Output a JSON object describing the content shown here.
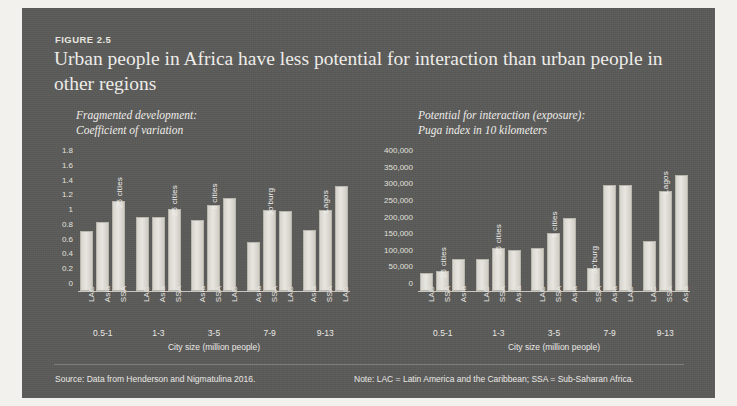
{
  "figure": {
    "label": "FIGURE 2.5",
    "title": "Urban people in Africa have less potential for interaction than urban people in other regions",
    "source": "Source: Data from Henderson and Nigmatulina 2016.",
    "note": "Note: LAC = Latin America and the Caribbean; SSA = Sub-Saharan Africa.",
    "card_color": "#5a5a59",
    "bar_color": "#e0ded7",
    "text_color": "#e9e7e2"
  },
  "chart_data": [
    {
      "type": "bar",
      "panel": "left",
      "title": "Fragmented development:\nCoefficient of variation",
      "subtitle_line1": "Fragmented development:",
      "subtitle_line2": "Coefficient of variation",
      "xlabel": "City size (million people)",
      "ylabel": "Coefficient of variation",
      "ylim": [
        0,
        1.8
      ],
      "yticks": [
        "0",
        "0.2",
        "0.4",
        "0.6",
        "0.8",
        "1",
        "1.2",
        "1.4",
        "1.6",
        "1.8"
      ],
      "ytick_values": [
        0,
        0.2,
        0.4,
        0.6,
        0.8,
        1.0,
        1.2,
        1.4,
        1.6,
        1.8
      ],
      "grid": false,
      "legend": "none",
      "categories": [
        "0.5-1",
        "1-3",
        "3-5",
        "7-9",
        "9-13"
      ],
      "groups": [
        {
          "category": "0.5-1",
          "bars": [
            {
              "label": "LAC",
              "value": 0.81,
              "annotation": ""
            },
            {
              "label": "Asia",
              "value": 0.94,
              "annotation": ""
            },
            {
              "label": "SSA",
              "value": 1.22,
              "annotation": "25 cities"
            }
          ]
        },
        {
          "category": "1-3",
          "bars": [
            {
              "label": "LAC",
              "value": 1.0,
              "annotation": ""
            },
            {
              "label": "Asia",
              "value": 1.0,
              "annotation": ""
            },
            {
              "label": "SSA",
              "value": 1.11,
              "annotation": "25 cities"
            }
          ]
        },
        {
          "category": "3-5",
          "bars": [
            {
              "label": "Asia",
              "value": 0.96,
              "annotation": ""
            },
            {
              "label": "SSA",
              "value": 1.17,
              "annotation": "6 cities"
            },
            {
              "label": "LAC",
              "value": 1.26,
              "annotation": ""
            }
          ]
        },
        {
          "category": "7-9",
          "bars": [
            {
              "label": "Asia",
              "value": 0.67,
              "annotation": ""
            },
            {
              "label": "SSA",
              "value": 1.1,
              "annotation": "Jo'burg"
            },
            {
              "label": "LAC",
              "value": 1.08,
              "annotation": ""
            }
          ]
        },
        {
          "category": "9-13",
          "bars": [
            {
              "label": "Asia",
              "value": 0.83,
              "annotation": ""
            },
            {
              "label": "SSA",
              "value": 1.1,
              "annotation": "Lagos"
            },
            {
              "label": "LAC",
              "value": 1.42,
              "annotation": ""
            }
          ]
        }
      ]
    },
    {
      "type": "bar",
      "panel": "right",
      "title": "Potential for interaction (exposure):\nPuga index in 10 kilometers",
      "subtitle_line1": "Potential for interaction (exposure):",
      "subtitle_line2": "Puga index in 10 kilometers",
      "xlabel": "City size (million people)",
      "ylabel": "Puga index in 10 kilometers",
      "ylim": [
        0,
        400000
      ],
      "yticks": [
        "0",
        "50,000",
        "100,000",
        "150,000",
        "200,000",
        "250,000",
        "300,000",
        "350,000",
        "400,000"
      ],
      "ytick_values": [
        0,
        50000,
        100000,
        150000,
        200000,
        250000,
        300000,
        350000,
        400000
      ],
      "grid": false,
      "legend": "none",
      "categories": [
        "0.5-1",
        "1-3",
        "3-5",
        "7-9",
        "9-13"
      ],
      "groups": [
        {
          "category": "0.5-1",
          "bars": [
            {
              "label": "LAC",
              "value": 55000,
              "annotation": ""
            },
            {
              "label": "SSA",
              "value": 60000,
              "annotation": "25 cities"
            },
            {
              "label": "Asia",
              "value": 95000,
              "annotation": ""
            }
          ]
        },
        {
          "category": "1-3",
          "bars": [
            {
              "label": "LAC",
              "value": 95000,
              "annotation": ""
            },
            {
              "label": "SSA",
              "value": 128000,
              "annotation": "25 cities"
            },
            {
              "label": "Asia",
              "value": 122000,
              "annotation": ""
            }
          ]
        },
        {
          "category": "3-5",
          "bars": [
            {
              "label": "LAC",
              "value": 130000,
              "annotation": ""
            },
            {
              "label": "SSA",
              "value": 175000,
              "annotation": "6 cities"
            },
            {
              "label": "Asia",
              "value": 220000,
              "annotation": ""
            }
          ]
        },
        {
          "category": "7-9",
          "bars": [
            {
              "label": "SSA",
              "value": 70000,
              "annotation": "Jo'burg"
            },
            {
              "label": "Asia",
              "value": 320000,
              "annotation": ""
            },
            {
              "label": "LAC",
              "value": 320000,
              "annotation": ""
            }
          ]
        },
        {
          "category": "9-13",
          "bars": [
            {
              "label": "LAC",
              "value": 150000,
              "annotation": ""
            },
            {
              "label": "SSA",
              "value": 300000,
              "annotation": "Lagos"
            },
            {
              "label": "Asia",
              "value": 350000,
              "annotation": ""
            }
          ]
        }
      ]
    }
  ]
}
